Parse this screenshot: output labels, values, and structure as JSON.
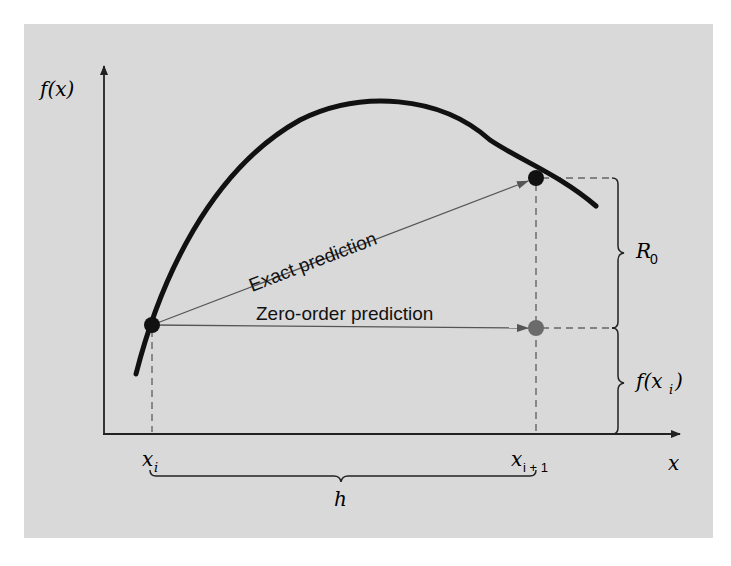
{
  "figure": {
    "type": "taylor-series-zero-order-illustration",
    "colors": {
      "background": "#d9d9d9",
      "curve": "#111111",
      "arrow": "#555555",
      "dashed": "#666666",
      "exact_point": "#111111",
      "zero_order_point": "#6b6b6b"
    },
    "axes": {
      "y_label": "f(x)",
      "x_label": "x"
    },
    "labels": {
      "exact_prediction": "Exact prediction",
      "zero_order_prediction": "Zero-order prediction",
      "remainder": "R",
      "remainder_sub": "0",
      "fxi_pre": "f(x",
      "fxi_sub": "i",
      "fxi_post": ")",
      "xi": "x",
      "xi_sub": "i",
      "xi1": "x",
      "xi1_sub": "i + 1",
      "step": "h"
    },
    "points": {
      "start": {
        "x": 152,
        "y": 325
      },
      "exact_end": {
        "x": 536,
        "y": 178
      },
      "zero_order_end": {
        "x": 536,
        "y": 328
      }
    }
  }
}
